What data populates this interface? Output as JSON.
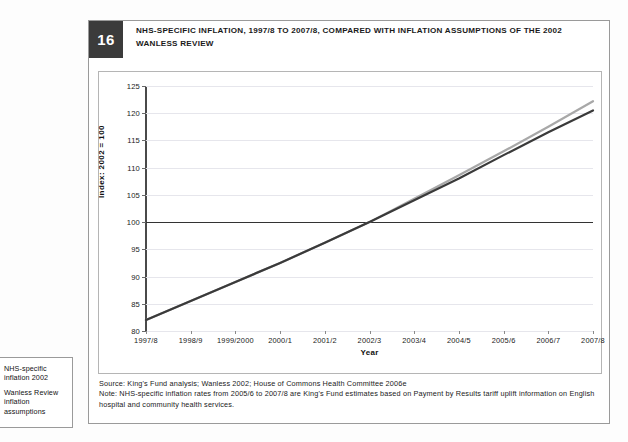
{
  "figure": {
    "number": "16",
    "title": "NHS-SPECIFIC INFLATION, 1997/8 TO 2007/8, COMPARED WITH INFLATION ASSUMPTIONS OF THE 2002 WANLESS REVIEW",
    "source_note": "Source: King's Fund analysis; Wanless 2002; House of Commons Health Committee 2006e",
    "method_note": "Note: NHS-specific inflation rates from 2005/6 to 2007/8 are King's Fund estimates based on Payment by Results tariff uplift information on English hospital and community health services."
  },
  "legend": {
    "items": [
      {
        "label": "NHS-specific inflation 2002",
        "color": "#3a3a3a"
      },
      {
        "label": "Wanless Review inflation assumptions",
        "color": "#a8a8a8"
      }
    ]
  },
  "chart_data": {
    "type": "line",
    "title": "NHS-SPECIFIC INFLATION, 1997/8 TO 2007/8, COMPARED WITH INFLATION ASSUMPTIONS OF THE 2002 WANLESS REVIEW",
    "xlabel": "Year",
    "ylabel": "Index: 2002 = 100",
    "categories": [
      "1997/8",
      "1998/9",
      "1999/2000",
      "2000/1",
      "2001/2",
      "2002/3",
      "2003/4",
      "2004/5",
      "2005/6",
      "2006/7",
      "2007/8"
    ],
    "ylim": [
      80,
      125
    ],
    "yticks": [
      80,
      85,
      90,
      95,
      100,
      105,
      110,
      115,
      120,
      125
    ],
    "grid": true,
    "reference_line": 100,
    "legend_position": "outside-bottom-left",
    "series": [
      {
        "name": "NHS-specific inflation 2002",
        "color": "#3a3a3a",
        "values": [
          82.0,
          85.5,
          89.0,
          92.5,
          96.2,
          100.0,
          104.0,
          108.0,
          112.3,
          116.5,
          120.5
        ]
      },
      {
        "name": "Wanless Review inflation assumptions",
        "color": "#a8a8a8",
        "values": [
          82.0,
          85.5,
          89.0,
          92.5,
          96.2,
          100.0,
          104.3,
          108.6,
          113.0,
          117.5,
          122.2
        ]
      }
    ]
  }
}
